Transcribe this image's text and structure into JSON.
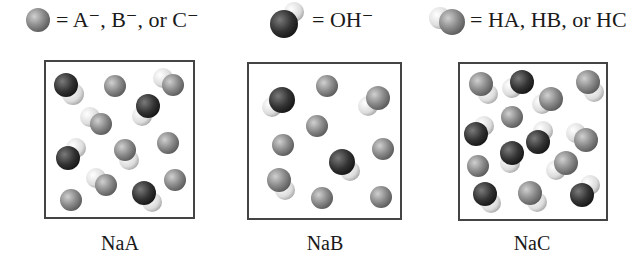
{
  "legend": [
    {
      "icon": "anion-sphere-icon",
      "text": "= A⁻, B⁻, or C⁻"
    },
    {
      "icon": "hydroxide-molecule-icon",
      "text": "= OH⁻"
    },
    {
      "icon": "weak-acid-molecule-icon",
      "text": "= HA, HB, or HC"
    }
  ],
  "boxes": [
    {
      "label": "NaA",
      "counts": {
        "anion": 4,
        "OH": 3,
        "acid": 4
      }
    },
    {
      "label": "NaB",
      "counts": {
        "anion": 7,
        "OH": 2,
        "acid": 2
      }
    },
    {
      "label": "NaC",
      "counts": {
        "anion": 2,
        "OH": 6,
        "acid": 7
      }
    }
  ],
  "colors": {
    "anion": "#8a8a8a",
    "oxygen": "#3a3a3a",
    "hydrogen": "#e6e6e6",
    "border": "#444444"
  }
}
